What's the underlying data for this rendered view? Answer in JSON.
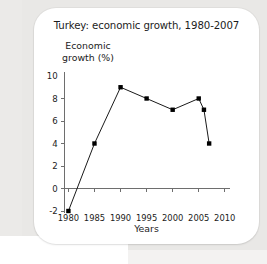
{
  "chart_data": {
    "type": "line",
    "title": "Turkey: economic growth, 1980-2007",
    "xlabel": "Years",
    "ylabel": "Economic growth (%)",
    "ylabel_line1": "Economic",
    "ylabel_line2": "growth (%)",
    "x": [
      1980,
      1985,
      1990,
      1995,
      2000,
      2005,
      2006,
      2007
    ],
    "values": [
      -2,
      4,
      9,
      8,
      7,
      8,
      7,
      4
    ],
    "series": [
      {
        "name": "Economic growth (%)",
        "values": [
          -2,
          4,
          9,
          8,
          7,
          8,
          7,
          4
        ]
      }
    ],
    "xlim": [
      1978,
      2011
    ],
    "ylim": [
      -2,
      10
    ],
    "xticks": [
      1980,
      1985,
      1990,
      1995,
      2000,
      2005,
      2010
    ],
    "xtick_labels": [
      "1980",
      "1985",
      "1990",
      "1995",
      "2000",
      "2005",
      "2010"
    ],
    "yticks": [
      -2,
      0,
      2,
      4,
      6,
      8,
      10
    ],
    "ytick_labels": [
      "-2",
      "0",
      "2",
      "4",
      "6",
      "8",
      "10"
    ],
    "grid": false,
    "legend": "none",
    "marker": "square",
    "line_color": "#1a1a1a",
    "marker_color": "#000000",
    "axis_color": "#6e6e6e",
    "background_color": "#ffffff",
    "page_background_color": "#e9e8e6"
  }
}
